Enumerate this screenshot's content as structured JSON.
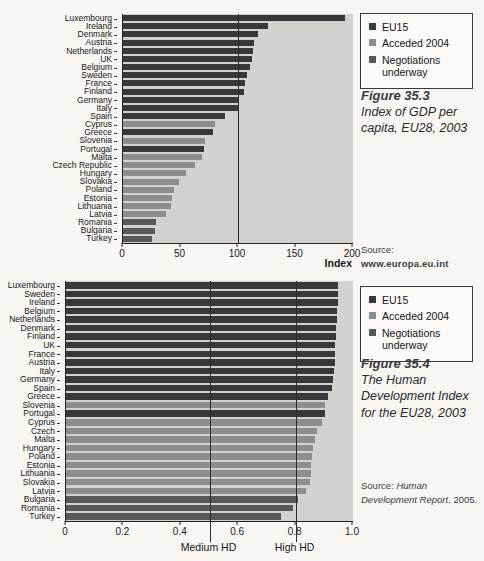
{
  "page_bg": "#f7f6f3",
  "colors": {
    "eu15": "#39393b",
    "acceded_2004": "#8d8d8d",
    "negotiations": "#59595b",
    "plot_bg": "#d2d1ce",
    "axis": "#222222"
  },
  "legend": {
    "items": [
      {
        "label": "EU15",
        "group": "eu15"
      },
      {
        "label": "Acceded 2004",
        "group": "acceded_2004"
      },
      {
        "label": "Negotiations underway",
        "group": "negotiations"
      }
    ]
  },
  "chart_data": [
    {
      "type": "bar",
      "orientation": "horizontal",
      "figure_label": "Figure 35.3",
      "figure_caption": "Index of GDP per capita, EU28, 2003",
      "xlabel": "Index",
      "xlim": [
        0,
        200
      ],
      "grid": false,
      "legend_position": "right",
      "xticks": [
        {
          "value": 0,
          "label": "0"
        },
        {
          "value": 50,
          "label": "50"
        },
        {
          "value": 100,
          "label": "100"
        },
        {
          "value": 150,
          "label": "150"
        },
        {
          "value": 200,
          "label": "200"
        }
      ],
      "reference_lines": [
        {
          "value": 100,
          "label": ""
        }
      ],
      "source_lines": [
        "Source:",
        "www.europa.eu.int"
      ],
      "bars": [
        {
          "country": "Luxembourg",
          "value": 193,
          "group": "eu15"
        },
        {
          "country": "Ireland",
          "value": 126,
          "group": "eu15"
        },
        {
          "country": "Denmark",
          "value": 117,
          "group": "eu15"
        },
        {
          "country": "Austria",
          "value": 114,
          "group": "eu15"
        },
        {
          "country": "Netherlands",
          "value": 113,
          "group": "eu15"
        },
        {
          "country": "UK",
          "value": 112,
          "group": "eu15"
        },
        {
          "country": "Belgium",
          "value": 110,
          "group": "eu15"
        },
        {
          "country": "Sweden",
          "value": 108,
          "group": "eu15"
        },
        {
          "country": "France",
          "value": 106,
          "group": "eu15"
        },
        {
          "country": "Finland",
          "value": 105,
          "group": "eu15"
        },
        {
          "country": "Germany",
          "value": 101,
          "group": "eu15"
        },
        {
          "country": "Italy",
          "value": 100,
          "group": "eu15"
        },
        {
          "country": "Spain",
          "value": 89,
          "group": "eu15"
        },
        {
          "country": "Cyprus",
          "value": 80,
          "group": "acceded_2004"
        },
        {
          "country": "Greece",
          "value": 78,
          "group": "eu15"
        },
        {
          "country": "Slovenia",
          "value": 71,
          "group": "acceded_2004"
        },
        {
          "country": "Portugal",
          "value": 70,
          "group": "eu15"
        },
        {
          "country": "Malta",
          "value": 69,
          "group": "acceded_2004"
        },
        {
          "country": "Czech Republic",
          "value": 63,
          "group": "acceded_2004"
        },
        {
          "country": "Hungary",
          "value": 55,
          "group": "acceded_2004"
        },
        {
          "country": "Slovakia",
          "value": 49,
          "group": "acceded_2004"
        },
        {
          "country": "Poland",
          "value": 44,
          "group": "acceded_2004"
        },
        {
          "country": "Estonia",
          "value": 43,
          "group": "acceded_2004"
        },
        {
          "country": "Lithuania",
          "value": 42,
          "group": "acceded_2004"
        },
        {
          "country": "Latvia",
          "value": 37,
          "group": "acceded_2004"
        },
        {
          "country": "Romania",
          "value": 29,
          "group": "negotiations"
        },
        {
          "country": "Bulgaria",
          "value": 28,
          "group": "negotiations"
        },
        {
          "country": "Turkey",
          "value": 25,
          "group": "negotiations"
        }
      ]
    },
    {
      "type": "bar",
      "orientation": "horizontal",
      "figure_label": "Figure 35.4",
      "figure_caption": "The Human Development Index for the EU28, 2003",
      "xlabel": "",
      "xlim": [
        0,
        1.0
      ],
      "grid": false,
      "legend_position": "right",
      "xticks": [
        {
          "value": 0,
          "label": "0"
        },
        {
          "value": 0.2,
          "label": "0.2"
        },
        {
          "value": 0.4,
          "label": "0.4"
        },
        {
          "value": 0.6,
          "label": "0.6"
        },
        {
          "value": 0.8,
          "label": "0.8"
        },
        {
          "value": 1.0,
          "label": "1.0"
        }
      ],
      "reference_lines": [
        {
          "value": 0.5,
          "label": "Medium HD"
        },
        {
          "value": 0.8,
          "label": "High HD"
        }
      ],
      "source_segments": {
        "prefix": "Source: ",
        "italic": "Human Development Report",
        "suffix": ", 2005."
      },
      "bars": [
        {
          "country": "Luxembourg",
          "value": 0.949,
          "group": "eu15"
        },
        {
          "country": "Sweden",
          "value": 0.949,
          "group": "eu15"
        },
        {
          "country": "Ireland",
          "value": 0.946,
          "group": "eu15"
        },
        {
          "country": "Belgium",
          "value": 0.945,
          "group": "eu15"
        },
        {
          "country": "Netherlands",
          "value": 0.943,
          "group": "eu15"
        },
        {
          "country": "Denmark",
          "value": 0.941,
          "group": "eu15"
        },
        {
          "country": "Finland",
          "value": 0.941,
          "group": "eu15"
        },
        {
          "country": "UK",
          "value": 0.939,
          "group": "eu15"
        },
        {
          "country": "France",
          "value": 0.938,
          "group": "eu15"
        },
        {
          "country": "Austria",
          "value": 0.936,
          "group": "eu15"
        },
        {
          "country": "Italy",
          "value": 0.934,
          "group": "eu15"
        },
        {
          "country": "Germany",
          "value": 0.93,
          "group": "eu15"
        },
        {
          "country": "Spain",
          "value": 0.928,
          "group": "eu15"
        },
        {
          "country": "Greece",
          "value": 0.912,
          "group": "eu15"
        },
        {
          "country": "Slovenia",
          "value": 0.904,
          "group": "acceded_2004"
        },
        {
          "country": "Portugal",
          "value": 0.904,
          "group": "eu15"
        },
        {
          "country": "Cyprus",
          "value": 0.891,
          "group": "acceded_2004"
        },
        {
          "country": "Czech",
          "value": 0.874,
          "group": "acceded_2004"
        },
        {
          "country": "Malta",
          "value": 0.867,
          "group": "acceded_2004"
        },
        {
          "country": "Hungary",
          "value": 0.862,
          "group": "acceded_2004"
        },
        {
          "country": "Poland",
          "value": 0.858,
          "group": "acceded_2004"
        },
        {
          "country": "Estonia",
          "value": 0.853,
          "group": "acceded_2004"
        },
        {
          "country": "Lithuania",
          "value": 0.852,
          "group": "acceded_2004"
        },
        {
          "country": "Slovakia",
          "value": 0.849,
          "group": "acceded_2004"
        },
        {
          "country": "Latvia",
          "value": 0.836,
          "group": "acceded_2004"
        },
        {
          "country": "Bulgaria",
          "value": 0.808,
          "group": "negotiations"
        },
        {
          "country": "Romania",
          "value": 0.792,
          "group": "negotiations"
        },
        {
          "country": "Turkey",
          "value": 0.75,
          "group": "negotiations"
        }
      ]
    }
  ]
}
